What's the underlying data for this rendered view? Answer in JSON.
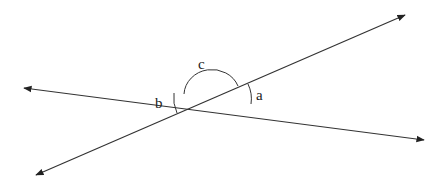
{
  "diagram": {
    "type": "intersecting-lines",
    "angle_labels": {
      "a": "a",
      "b": "b",
      "c": "c"
    },
    "line_color": "#333333"
  }
}
